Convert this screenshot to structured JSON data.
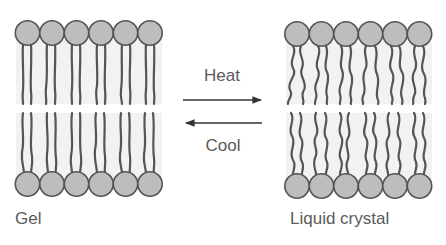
{
  "diagram": {
    "type": "lipid-bilayer-phase-transition",
    "colors": {
      "background": "#ffffff",
      "head_fill": "#bdbdbd",
      "head_stroke": "#555555",
      "tail_stroke": "#555555",
      "bilayer_bg": "#f2f2f2",
      "text": "#5a5a5a",
      "arrow": "#333333"
    },
    "left_panel": {
      "label": "Gel",
      "heads_per_leaflet": 6,
      "tail_style": "straight-ordered"
    },
    "right_panel": {
      "label": "Liquid crystal",
      "heads_per_leaflet": 6,
      "tail_style": "wavy-disordered"
    },
    "transition": {
      "forward_label": "Heat",
      "forward_direction": "right",
      "reverse_label": "Cool",
      "reverse_direction": "left"
    }
  }
}
